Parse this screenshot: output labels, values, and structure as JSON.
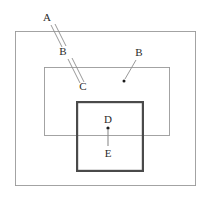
{
  "canvas": {
    "width": 212,
    "height": 199,
    "background": "#ffffff"
  },
  "diagram": {
    "type": "line-diagram"
  },
  "colors": {
    "outer_rect_stroke": "#9a9a9a",
    "middle_rect_stroke": "#9a9a9a",
    "inner_rect_stroke": "#4a4a4a",
    "leader_line": "#8d8d8d",
    "label_text": "#2b2b2b",
    "marker_dot": "#1c1c1c",
    "background": "#ffffff"
  },
  "shapes": {
    "outer_rect": {
      "name": "outer-rectangle",
      "x": 15,
      "y": 31,
      "width": 181,
      "height": 155,
      "stroke_width": 0.9
    },
    "middle_rect": {
      "name": "middle-rectangle",
      "x": 44,
      "y": 67,
      "width": 126,
      "height": 69,
      "stroke_width": 0.9
    },
    "inner_rect": {
      "name": "inner-square",
      "x": 76,
      "y": 101,
      "width": 68,
      "height": 71,
      "stroke_width": 2.2
    }
  },
  "labels": {
    "a": {
      "text": "A",
      "x": 47,
      "y": 21
    },
    "b_left": {
      "text": "B",
      "x": 63,
      "y": 55
    },
    "c": {
      "text": "C",
      "x": 83,
      "y": 90
    },
    "b_right": {
      "text": "B",
      "x": 139,
      "y": 56
    },
    "d": {
      "text": "D",
      "x": 108,
      "y": 123
    },
    "e": {
      "text": "E",
      "x": 108,
      "y": 157
    }
  },
  "leaders": {
    "a_to_b": {
      "name": "leader-a-to-b",
      "stroke_width": 0.9,
      "line1": {
        "x1": 51,
        "y1": 25,
        "x2": 62,
        "y2": 47
      },
      "line2": {
        "x1": 55,
        "y1": 24,
        "x2": 66,
        "y2": 46
      }
    },
    "b_to_c": {
      "name": "leader-b-to-c",
      "stroke_width": 0.9,
      "line1": {
        "x1": 68,
        "y1": 59,
        "x2": 80,
        "y2": 83
      },
      "line2": {
        "x1": 72,
        "y1": 58,
        "x2": 84,
        "y2": 82
      }
    },
    "b_right_to_dot": {
      "name": "leader-b-right-to-dot",
      "stroke_width": 0.9,
      "line1": {
        "x1": 136,
        "y1": 60,
        "x2": 125,
        "y2": 79
      },
      "dot": {
        "cx": 124,
        "cy": 81,
        "r": 1.5
      }
    },
    "d_to_e": {
      "name": "leader-d-to-e",
      "stroke_width": 1.1,
      "dot": {
        "cx": 108,
        "cy": 128,
        "r": 1.6
      },
      "line1": {
        "x1": 108,
        "y1": 129,
        "x2": 108,
        "y2": 146
      }
    }
  }
}
